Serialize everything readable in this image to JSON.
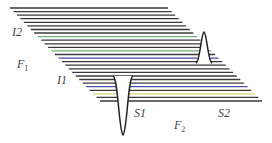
{
  "diagram": {
    "type": "stacked-line pseudo-3D spectrum",
    "line_count": 27,
    "line_color": "#3a3a3e",
    "accent_colors": {
      "green": "#6fae78",
      "blue": "#4a4fb0",
      "yellow": "#d8d27a"
    },
    "labels": {
      "i2": "I2",
      "f1": "F",
      "f1_sub": "1",
      "i1": "I1",
      "s1": "S1",
      "f2": "F",
      "f2_sub": "2",
      "s2": "S2"
    },
    "peaks": [
      {
        "name": "S2",
        "direction": "up"
      },
      {
        "name": "S1",
        "direction": "down"
      }
    ]
  }
}
